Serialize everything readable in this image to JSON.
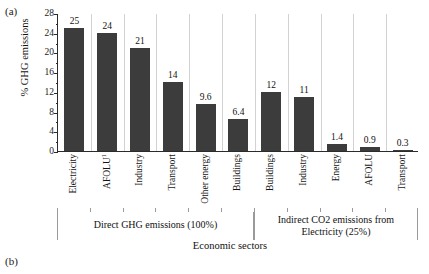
{
  "figure": {
    "panel_a_label": "(a)",
    "panel_b_label": "(b)"
  },
  "chart_data": {
    "type": "bar",
    "title": "",
    "xlabel": "Economic sectors",
    "ylabel": "% GHG emissions",
    "ylim": [
      0,
      28
    ],
    "ytick_values": [
      "0",
      "4",
      "8",
      "12",
      "16",
      "20",
      "24",
      "28"
    ],
    "ytick_step": 4,
    "minor_tick_step": 2,
    "grid": false,
    "legend": "none",
    "bar_color": "#3c3c3c",
    "categories": [
      "Electricity",
      "AFOLU",
      "Industry",
      "Transport",
      "Other energy",
      "Buildings",
      "Buildings",
      "Industry",
      "Energy",
      "AFOLU",
      "Transport"
    ],
    "category_superscripts": [
      "",
      "1",
      "",
      "",
      "",
      "",
      "",
      "",
      "",
      "",
      ""
    ],
    "values": [
      25,
      24,
      21,
      14,
      9.6,
      6.4,
      12,
      11,
      1.4,
      0.9,
      0.3
    ],
    "value_labels": [
      "25",
      "24",
      "21",
      "14",
      "9.6",
      "6.4",
      "12",
      "11",
      "1.4",
      "0.9",
      "0.3"
    ],
    "groups": [
      {
        "label": "Direct GHG emissions (100%)",
        "line1": "Direct GHG emissions (100%)",
        "line2": "",
        "start": 0,
        "end": 5
      },
      {
        "label": "Indirect CO2 emissions from Electricity (25%)",
        "line1": "Indirect CO2 emissions from",
        "line2": "Electricity (25%)",
        "start": 6,
        "end": 10
      }
    ]
  }
}
